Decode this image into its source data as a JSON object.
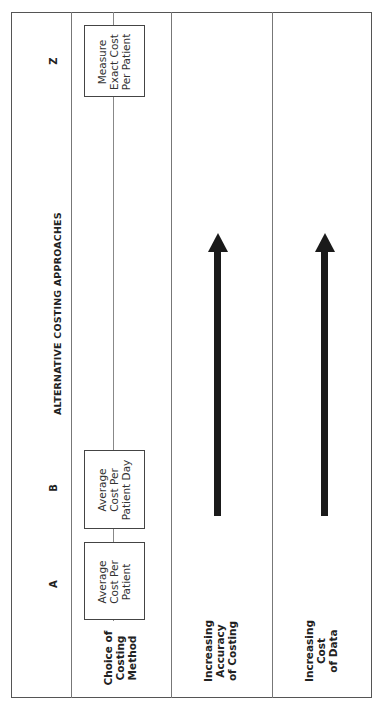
{
  "diagram": {
    "title": "ALTERNATIVE COSTING APPROACHES",
    "orientation": "rotated 90° counter-clockwise (landscape table printed on portrait page)",
    "columns": [
      {
        "letter": "A",
        "method": "Average\nCost Per\nPatient"
      },
      {
        "letter": "B",
        "method": "Average\nCost Per\nPatient Day"
      },
      {
        "letter": "Z",
        "method": "Measure\nExact Cost\nPer Patient"
      }
    ],
    "rows": [
      {
        "label": "Choice of\nCosting\nMethod"
      },
      {
        "label": "Increasing\nAccuracy\nof Costing",
        "arrow": "from B toward Z"
      },
      {
        "label": "Increasing\nCost\nof Data",
        "arrow": "from B toward Z"
      }
    ],
    "colors": {
      "line": "#555555",
      "arrow": "#1a1a1a",
      "background": "#ffffff"
    }
  }
}
